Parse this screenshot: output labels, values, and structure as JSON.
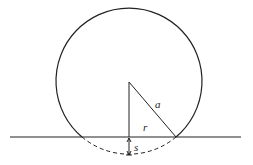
{
  "diagram": {
    "title": "",
    "labels": {
      "hypotenuse": "a",
      "vertical_leg": "r",
      "sag": "s"
    },
    "colors": {
      "stroke": "#222222",
      "background": "#ffffff"
    }
  }
}
